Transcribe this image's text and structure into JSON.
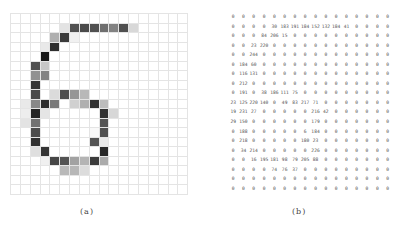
{
  "figure": {
    "caption_a": "(a)",
    "caption_b": "(b)",
    "grid_size": {
      "rows": 19,
      "cols": 18
    },
    "grid_offset": {
      "row": 0,
      "col": 1
    },
    "line_color": "#e4e4e4"
  },
  "matrix": [
    [
      0,
      0,
      0,
      0,
      0,
      0,
      0,
      0,
      0,
      0,
      0,
      0,
      0,
      0,
      0,
      0
    ],
    [
      0,
      0,
      0,
      0,
      30,
      183,
      191,
      184,
      152,
      132,
      184,
      41,
      0,
      0,
      0,
      0
    ],
    [
      0,
      0,
      0,
      84,
      206,
      15,
      0,
      0,
      0,
      0,
      0,
      0,
      0,
      0,
      0,
      0
    ],
    [
      0,
      0,
      23,
      220,
      0,
      0,
      0,
      0,
      0,
      0,
      0,
      0,
      0,
      0,
      0,
      0
    ],
    [
      0,
      0,
      244,
      0,
      0,
      0,
      0,
      0,
      0,
      0,
      0,
      0,
      0,
      0,
      0,
      0
    ],
    [
      0,
      184,
      60,
      0,
      0,
      0,
      0,
      0,
      0,
      0,
      0,
      0,
      0,
      0,
      0,
      0
    ],
    [
      0,
      116,
      131,
      0,
      0,
      0,
      0,
      0,
      0,
      0,
      0,
      0,
      0,
      0,
      0,
      0
    ],
    [
      0,
      212,
      0,
      0,
      0,
      0,
      0,
      0,
      0,
      0,
      0,
      0,
      0,
      0,
      0,
      0
    ],
    [
      0,
      191,
      0,
      38,
      186,
      111,
      75,
      0,
      0,
      0,
      0,
      0,
      0,
      0,
      0,
      0
    ],
    [
      23,
      125,
      220,
      140,
      0,
      49,
      83,
      217,
      71,
      0,
      0,
      0,
      0,
      0,
      0,
      0
    ],
    [
      19,
      231,
      27,
      0,
      0,
      0,
      0,
      0,
      216,
      42,
      0,
      0,
      0,
      0,
      0,
      0
    ],
    [
      29,
      150,
      0,
      0,
      0,
      0,
      0,
      0,
      179,
      0,
      0,
      0,
      0,
      0,
      0,
      0
    ],
    [
      0,
      188,
      0,
      0,
      0,
      0,
      0,
      6,
      184,
      0,
      0,
      0,
      0,
      0,
      0,
      0
    ],
    [
      0,
      218,
      0,
      0,
      0,
      0,
      0,
      180,
      23,
      0,
      0,
      0,
      0,
      0,
      0,
      0
    ],
    [
      0,
      34,
      214,
      0,
      0,
      0,
      0,
      0,
      226,
      0,
      0,
      0,
      0,
      0,
      0,
      0
    ],
    [
      0,
      0,
      16,
      195,
      181,
      98,
      79,
      205,
      88,
      0,
      0,
      0,
      0,
      0,
      0,
      0
    ],
    [
      0,
      0,
      0,
      0,
      74,
      76,
      37,
      0,
      0,
      0,
      0,
      0,
      0,
      0,
      0,
      0
    ],
    [
      0,
      0,
      0,
      0,
      0,
      0,
      0,
      0,
      0,
      0,
      0,
      0,
      0,
      0,
      0,
      0
    ],
    [
      0,
      0,
      0,
      0,
      0,
      0,
      0,
      0,
      0,
      0,
      0,
      0,
      0,
      0,
      0,
      0
    ]
  ]
}
